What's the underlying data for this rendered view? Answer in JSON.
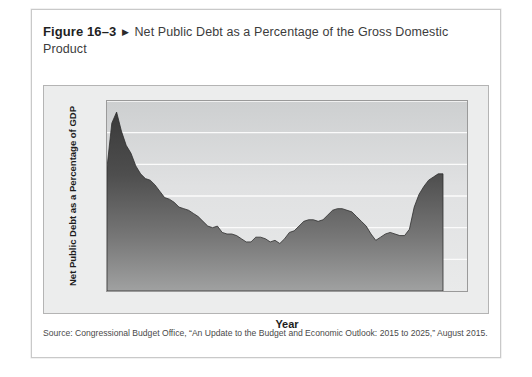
{
  "figure": {
    "number": "Figure 16–3",
    "arrow": "▶",
    "title": "Net Public Debt as a Percentage of the Gross Domestic Product",
    "source": "Source: Congressional Budget Office, “An Update to the Budget and Economic Outlook: 2015 to 2025,” August 2015."
  },
  "chart_data": {
    "type": "area",
    "title": "Net Public Debt as a Percentage of the Gross Domestic Product",
    "xlabel": "Year",
    "ylabel": "Net Public Debt as a Percentage of GDP",
    "xlim": [
      1945,
      2020
    ],
    "ylim": [
      0,
      120
    ],
    "ytick_labels": [
      "0",
      "20",
      "40",
      "60",
      "80",
      "100",
      "120"
    ],
    "yticks": [
      0,
      20,
      40,
      60,
      80,
      100,
      120
    ],
    "ytick_minor_step": 10,
    "xtick_labels": [
      "1950",
      "1960",
      "1970",
      "1980",
      "1990",
      "2000",
      "2010",
      "2020"
    ],
    "xticks": [
      1950,
      1960,
      1970,
      1980,
      1990,
      2000,
      2010,
      2020
    ],
    "xtick_minor_step": 5,
    "grid": "horizontal",
    "legend": "none",
    "fill_color_top": "#3c3c3c",
    "fill_color_bottom": "#9a9a9a",
    "series": [
      {
        "name": "Net public debt as a percentage of GDP",
        "x": [
          1945,
          1946,
          1947,
          1948,
          1949,
          1950,
          1951,
          1952,
          1953,
          1954,
          1955,
          1956,
          1957,
          1958,
          1959,
          1960,
          1961,
          1962,
          1963,
          1964,
          1965,
          1966,
          1967,
          1968,
          1969,
          1970,
          1971,
          1972,
          1973,
          1974,
          1975,
          1976,
          1977,
          1978,
          1979,
          1980,
          1981,
          1982,
          1983,
          1984,
          1985,
          1986,
          1987,
          1988,
          1989,
          1990,
          1991,
          1992,
          1993,
          1994,
          1995,
          1996,
          1997,
          1998,
          1999,
          2000,
          2001,
          2002,
          2003,
          2004,
          2005,
          2006,
          2007,
          2008,
          2009,
          2010,
          2011,
          2012,
          2013,
          2014,
          2015
        ],
        "values": [
          78,
          106,
          113,
          101,
          92,
          87,
          79,
          74,
          71,
          70,
          67,
          63,
          59,
          58,
          56,
          53,
          52,
          51,
          49,
          47,
          44,
          41,
          40,
          41,
          37,
          36,
          36,
          35,
          33,
          31,
          31,
          34,
          34,
          33,
          31,
          32,
          30,
          33,
          37,
          38,
          41,
          44,
          45,
          45,
          44,
          45,
          48,
          51,
          52,
          52,
          51,
          50,
          47,
          44,
          41,
          36,
          32,
          34,
          36,
          37,
          36,
          35,
          35,
          39,
          53,
          61,
          66,
          70,
          72,
          74,
          74
        ]
      }
    ]
  }
}
